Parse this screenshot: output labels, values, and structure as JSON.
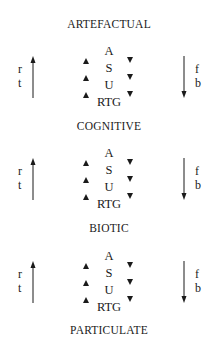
{
  "diagram": {
    "levels": [
      {
        "title": "ARTEFACTUAL"
      },
      {
        "title": "COGNITIVE"
      },
      {
        "title": "BIOTIC"
      },
      {
        "title": "PARTICULATE"
      }
    ],
    "connectors": [
      {
        "stack": [
          "A",
          "S",
          "U",
          "RTG"
        ],
        "left_labels": [
          "r",
          "t"
        ],
        "right_labels": [
          "f",
          "b"
        ]
      },
      {
        "stack": [
          "A",
          "S",
          "U",
          "RTG"
        ],
        "left_labels": [
          "r",
          "t"
        ],
        "right_labels": [
          "f",
          "b"
        ]
      },
      {
        "stack": [
          "A",
          "S",
          "U",
          "RTG"
        ],
        "left_labels": [
          "r",
          "t"
        ],
        "right_labels": [
          "f",
          "b"
        ]
      }
    ],
    "icons": {
      "left_arrow": "arrow-up-icon",
      "right_arrow": "arrow-down-icon",
      "small_up": "triangle-up-icon",
      "small_down": "triangle-down-icon"
    }
  }
}
